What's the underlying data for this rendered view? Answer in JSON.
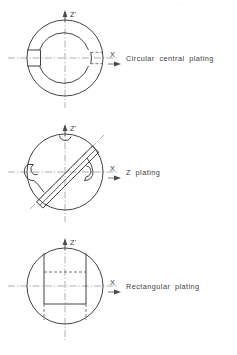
{
  "page": {
    "background_color": "#ffffff",
    "line_color": "#2e2e2e",
    "centerline_color": "#8d8d8d",
    "hidden_line_color": "#4a4a4a",
    "text_color": "#3d3d3d",
    "header_fragment": "··"
  },
  "axes": {
    "vertical_label": "Z'",
    "horizontal_label": "X"
  },
  "figures": [
    {
      "id": "figure-circular-central-plating",
      "caption": "Circular  central  plating",
      "shape": "annulus-with-keyway",
      "outer_radius": 38,
      "inner_radius": 26,
      "center": {
        "x": 65,
        "y": 58
      },
      "feature": "left keyway slot, right dashed slot"
    },
    {
      "id": "figure-z-plating",
      "caption": "Z  plating",
      "shape": "circle-with-diagonal-band",
      "outer_radius": 38,
      "center": {
        "x": 65,
        "y": 58
      },
      "band_angle_deg": 45,
      "feature": "diagonal Z band with top, left and right notches"
    },
    {
      "id": "figure-rectangular-plating",
      "caption": "Rectangular  plating",
      "shape": "circle-with-rectangle",
      "outer_radius": 38,
      "center": {
        "x": 65,
        "y": 58
      },
      "rect": {
        "width": 44,
        "height": 56
      },
      "feature": "rectangular plate with hidden dashed edges"
    }
  ]
}
